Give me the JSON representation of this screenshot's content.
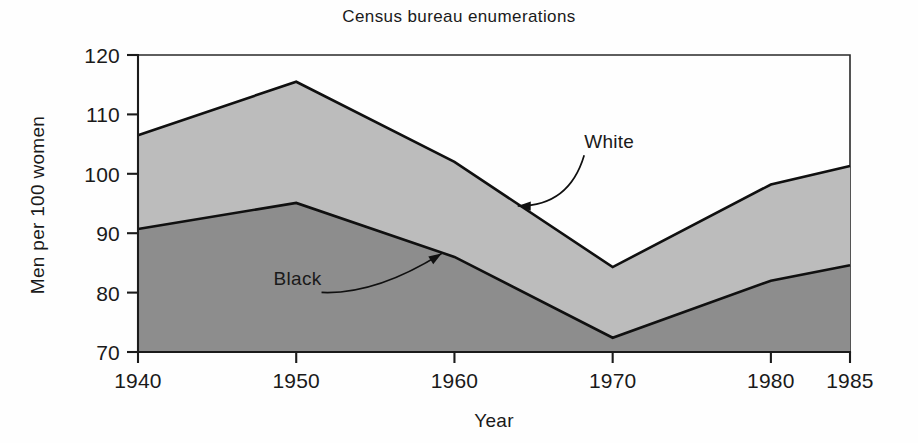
{
  "chart_data": {
    "type": "area",
    "title": "Census bureau enumerations",
    "subtitle": "",
    "xlabel": "Year",
    "ylabel": "Men per 100 women",
    "x": [
      1940,
      1950,
      1960,
      1970,
      1980,
      1985
    ],
    "categories": [
      "1940",
      "1950",
      "1960",
      "1970",
      "1980",
      "1985"
    ],
    "xtick_labels": [
      "1940",
      "1950",
      "1960",
      "1970",
      "1980",
      "1985"
    ],
    "ytick_labels": [
      "70",
      "80",
      "90",
      "100",
      "110",
      "120"
    ],
    "ytick_values": [
      70,
      80,
      90,
      100,
      110,
      120
    ],
    "xlim": [
      1940,
      1985
    ],
    "ylim": [
      70,
      120
    ],
    "grid": false,
    "legend_position": "inline-annotations",
    "stacked": false,
    "baseline": 70,
    "series": [
      {
        "name": "White",
        "label": "White",
        "color": "#bcbcbc",
        "line_color": "#101010",
        "values": [
          106.5,
          115.5,
          102.0,
          84.3,
          98.2,
          101.3
        ]
      },
      {
        "name": "Black",
        "label": "Black",
        "color": "#8d8d8d",
        "line_color": "#101010",
        "values": [
          90.7,
          95.1,
          86.0,
          72.4,
          82.0,
          84.6
        ]
      }
    ],
    "annotations": [
      {
        "text": "White",
        "label_x": 1968.2,
        "label_y": 104.3,
        "target_x": 1964.0,
        "target_y": 94.6
      },
      {
        "text": "Black",
        "label_x": 1951.6,
        "label_y": 81.2,
        "target_x": 1959.2,
        "target_y": 86.6
      }
    ]
  },
  "figure": {
    "background": "#fefefe",
    "axis_color": "#1b1b1b"
  }
}
